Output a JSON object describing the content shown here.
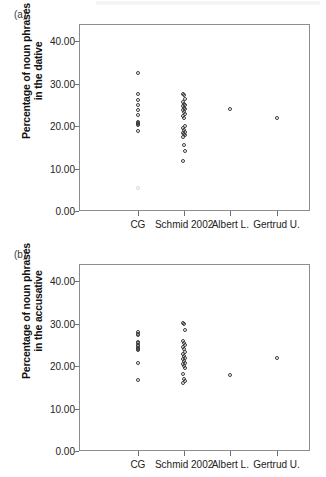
{
  "figure": {
    "panels": [
      {
        "id": "a",
        "label": "(a)",
        "ylabel_line1": "Percentage of noun phrases",
        "ylabel_line2": "in the dative"
      },
      {
        "id": "b",
        "label": "(b)",
        "ylabel_line1": "Percentage of noun phrases",
        "ylabel_line2": "in the accusative"
      }
    ]
  },
  "chart_data": [
    {
      "type": "scatter",
      "title": "(a)",
      "xlabel": "",
      "ylabel": "Percentage of noun phrases in the dative",
      "categories": [
        "CG",
        "Schmid 2002",
        "Albert L.",
        "Gertrud U."
      ],
      "yticks": [
        "0.00",
        "10.00",
        "20.00",
        "30.00",
        "40.00"
      ],
      "ylim": [
        0,
        44
      ],
      "grid": false,
      "legend": null,
      "series": [
        {
          "name": "CG",
          "values": [
            32.5,
            27.6,
            26.1,
            24.9,
            23.8,
            22.6,
            21.0,
            20.7,
            20.4,
            20.2,
            18.8,
            5.4
          ]
        },
        {
          "name": "Schmid 2002",
          "values": [
            27.6,
            27.3,
            26.3,
            25.6,
            25.2,
            24.9,
            24.6,
            24.3,
            24.0,
            23.7,
            23.4,
            22.9,
            22.4,
            21.9,
            19.9,
            19.5,
            19.1,
            18.7,
            18.4,
            18.1,
            17.8,
            17.5,
            15.5,
            14.2,
            11.8
          ]
        },
        {
          "name": "Albert L.",
          "values": [
            24.1
          ]
        },
        {
          "name": "Gertrud U.",
          "values": [
            22.0
          ]
        }
      ]
    },
    {
      "type": "scatter",
      "title": "(b)",
      "xlabel": "",
      "ylabel": "Percentage of noun phrases in the accusative",
      "categories": [
        "CG",
        "Schmid 2002",
        "Albert L.",
        "Gertrud U."
      ],
      "yticks": [
        "0.00",
        "10.00",
        "20.00",
        "30.00",
        "40.00"
      ],
      "ylim": [
        0,
        44
      ],
      "grid": false,
      "legend": null,
      "series": [
        {
          "name": "CG",
          "values": [
            28.1,
            27.6,
            27.4,
            25.7,
            25.3,
            24.9,
            24.6,
            24.3,
            24.0,
            23.7,
            20.8,
            16.8
          ]
        },
        {
          "name": "Schmid 2002",
          "values": [
            30.2,
            29.9,
            28.4,
            25.8,
            25.4,
            25.0,
            24.4,
            23.9,
            23.4,
            22.9,
            22.4,
            22.0,
            21.6,
            21.2,
            20.8,
            20.4,
            20.0,
            19.6,
            18.2,
            17.0,
            16.5,
            16.1
          ]
        },
        {
          "name": "Albert L.",
          "values": [
            18.0
          ]
        },
        {
          "name": "Gertrud U.",
          "values": [
            22.0
          ]
        }
      ]
    }
  ]
}
